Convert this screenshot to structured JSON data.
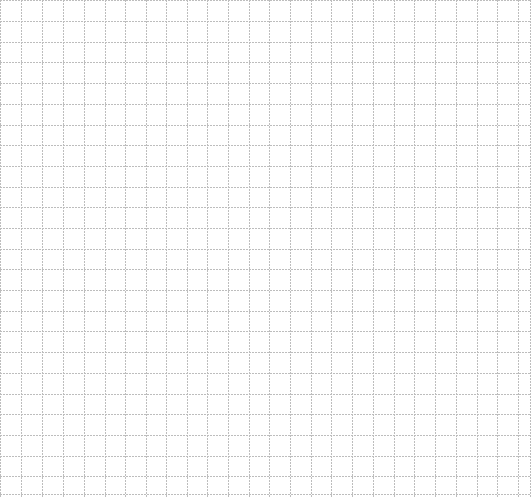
{
  "canvas": {
    "width": 531,
    "height": 497,
    "background_color": "#ffffff"
  },
  "grid": {
    "type": "graph-paper",
    "line_style": "dotted",
    "line_color": "#bdbdbd",
    "cell_size": 20.7,
    "columns": 25,
    "rows": 24,
    "vertical_lines_x": [
      0.5,
      21,
      42,
      63,
      84,
      105,
      125,
      146,
      166,
      187,
      207,
      228,
      249,
      269,
      290,
      311,
      331,
      352,
      373,
      394,
      414,
      435,
      456,
      477,
      497,
      518,
      530
    ],
    "horizontal_lines_y": [
      0.5,
      21,
      42,
      62,
      83,
      104,
      125,
      145,
      166,
      187,
      207,
      228,
      249,
      269,
      290,
      311,
      331,
      352,
      373,
      394,
      414,
      435,
      456,
      476,
      494
    ]
  }
}
